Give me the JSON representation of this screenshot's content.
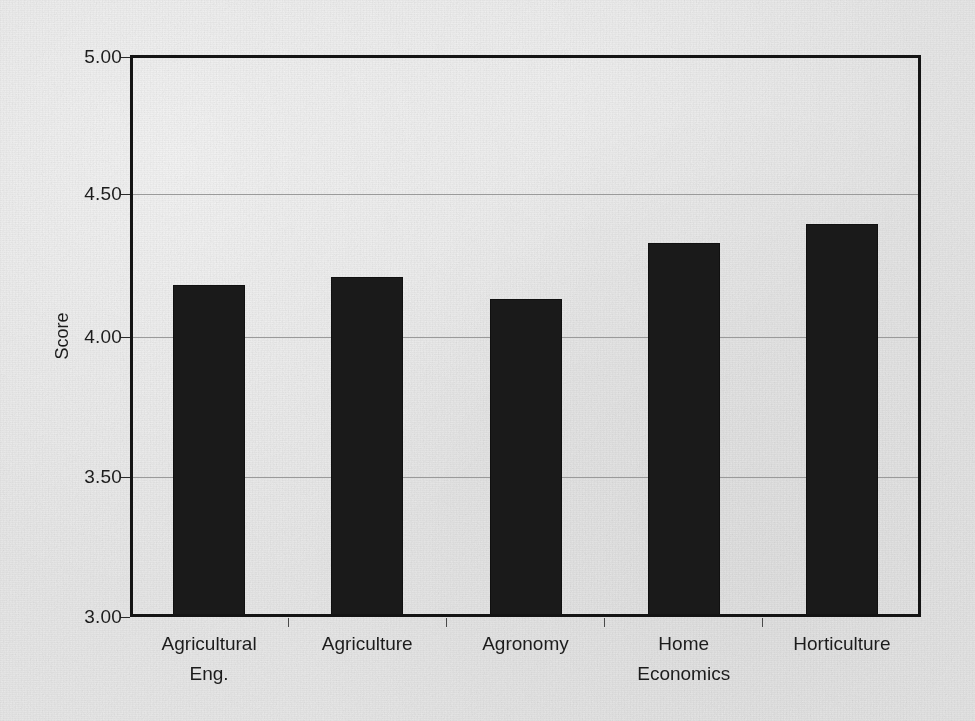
{
  "chart_data": {
    "type": "bar",
    "title": "",
    "xlabel": "",
    "ylabel": "Score",
    "categories": [
      "Agricultural\nEng.",
      "Agriculture",
      "Agronomy",
      "Home\nEconomics",
      "Horticulture"
    ],
    "values": [
      4.18,
      4.21,
      4.13,
      4.33,
      4.4
    ],
    "ylim": [
      3.0,
      5.0
    ],
    "ytick_labels": [
      "5.00",
      "4.50",
      "4.00",
      "3.50",
      "3.00"
    ],
    "ytick_values": [
      5.0,
      4.5,
      4.0,
      3.5,
      3.0
    ],
    "grid": true,
    "grid_axis": "y",
    "legend": "none",
    "bar_color": "#1a1a1a",
    "background_color": "#e9e9e9",
    "axis_color": "#141414",
    "gridline_color": "#9a9a9a"
  }
}
